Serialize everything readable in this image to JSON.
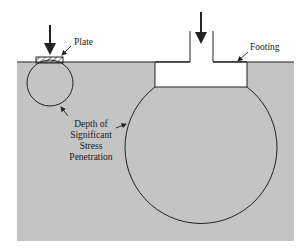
{
  "diagram": {
    "labels": {
      "plate": "Plate",
      "footing": "Footing",
      "depth_line1": "Depth of",
      "depth_line2": "Significant",
      "depth_line3": "Stress",
      "depth_line4": "Penetration"
    },
    "colors": {
      "soil": "#c4c4c4",
      "line": "#222222",
      "background": "#ffffff"
    }
  }
}
